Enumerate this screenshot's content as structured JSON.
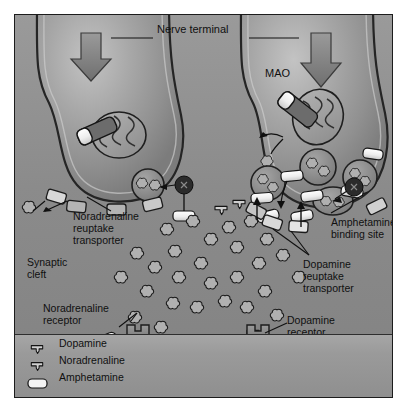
{
  "figure": {
    "title_label": "Nerve terminal",
    "domain": "neuroscience-synapse-diagram",
    "background_color": "#8e8e8e",
    "border_color": "#1c1c1c",
    "ink_color": "#101010"
  },
  "labels": {
    "nerve_terminal": "Nerve terminal",
    "mao": "MAO",
    "noradrenaline_reuptake_transporter": "Noradrenaline\nreuptake\ntransporter",
    "synaptic_cleft": "Synaptic\ncleft",
    "noradrenaline_receptor": "Noradrenaline\nreceptor",
    "amphetamine_binding_site": "Amphetamine\nbinding site",
    "dopamine_reuptake_transporter": "Dopamine\nreuptake\ntransporter",
    "dopamine_receptor": "Dopamine\nreceptor",
    "postsynaptic_membrane": "Postsynaptic membrane"
  },
  "legend": {
    "items": [
      {
        "icon": "trefoil-glyph",
        "label": "Dopamine"
      },
      {
        "icon": "trefoil-glyph",
        "label": "Noradrenaline"
      },
      {
        "icon": "capsule-glyph",
        "label": "Amphetamine"
      }
    ]
  },
  "terminals": [
    {
      "name": "noradrenaline-terminal",
      "side": "left"
    },
    {
      "name": "dopamine-terminal",
      "side": "right"
    }
  ],
  "colors": {
    "cytoplasm_light": "#b9b9b9",
    "cytoplasm_mid": "#a3a3a3",
    "cytoplasm_dark": "#7e7e7e",
    "cleft": "#8e8e8e",
    "membrane_outline": "#2a2a2a",
    "capsule_fill": "#f2f2f2",
    "vesicle_fill": "#8d8d8d",
    "dark_node": "#2b2b2b",
    "mitochondrion_fill": "#9e9e9e"
  }
}
